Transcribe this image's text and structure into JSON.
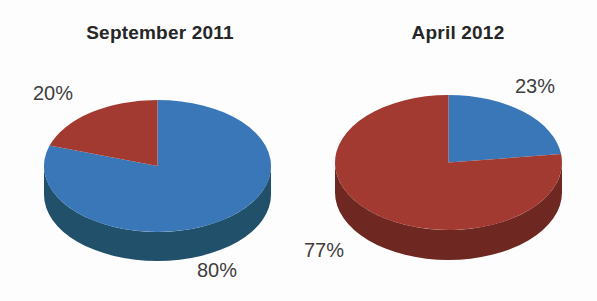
{
  "page": {
    "background_color": "#fdfdfd"
  },
  "chart_data": [
    {
      "type": "pie",
      "style": "3d",
      "title": "September 2011",
      "start_angle_deg": 90,
      "direction": "clockwise",
      "legend": "none",
      "slices": [
        {
          "value": 80,
          "label": "80%",
          "top_color": "#3a77b8",
          "side_color": "#21506b"
        },
        {
          "value": 20,
          "label": "20%",
          "top_color": "#a33a31",
          "side_color": "#6e2821"
        }
      ]
    },
    {
      "type": "pie",
      "style": "3d",
      "title": "April 2012",
      "start_angle_deg": 90,
      "direction": "clockwise",
      "legend": "none",
      "slices": [
        {
          "value": 23,
          "label": "23%",
          "top_color": "#3a77b8",
          "side_color": "#21506b"
        },
        {
          "value": 77,
          "label": "77%",
          "top_color": "#a33a31",
          "side_color": "#6e2821"
        }
      ]
    }
  ]
}
